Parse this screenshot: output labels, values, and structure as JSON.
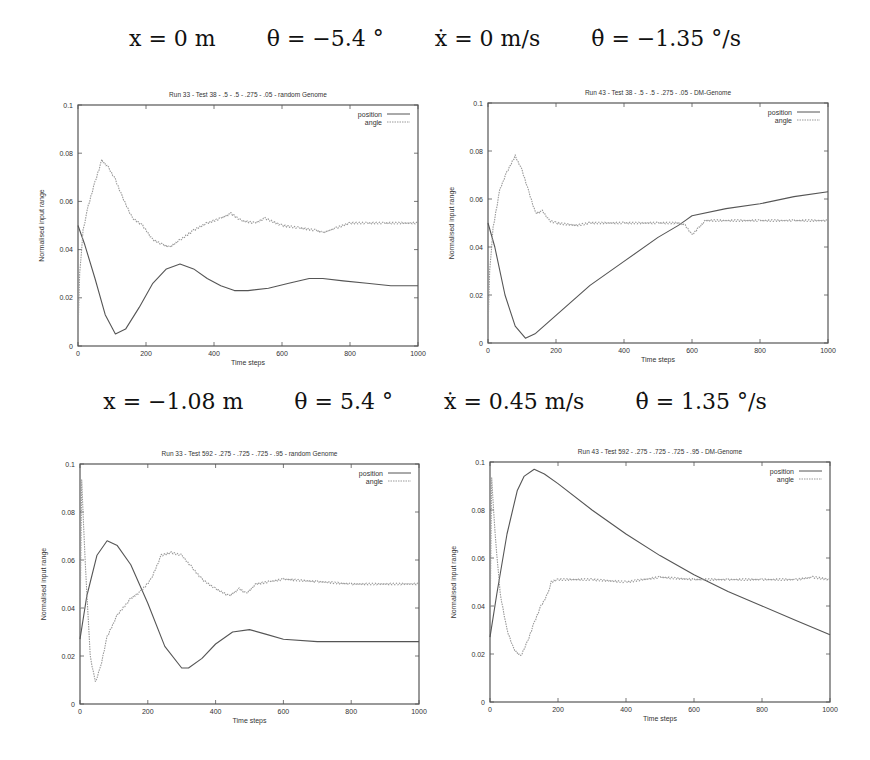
{
  "conditions": [
    {
      "x": "x = 0 m",
      "theta": "θ = −5.4 °",
      "xdot": "ẋ = 0 m/s",
      "thetadot": "θ̇ = −1.35 °/s"
    },
    {
      "x": "x = −1.08 m",
      "theta": "θ = 5.4 °",
      "xdot": "ẋ = 0.45 m/s",
      "thetadot": "θ̇ = 1.35 °/s"
    }
  ],
  "chart_data": [
    {
      "type": "line",
      "title": "Run 33 - Test 38 - .5 - .5 - .275 - .05 - random Genome",
      "xlabel": "Time steps",
      "ylabel": "Normalised input range",
      "xlim": [
        0,
        1000
      ],
      "ylim": [
        0,
        0.1
      ],
      "xticks": [
        "0",
        "200",
        "400",
        "600",
        "800",
        "1000"
      ],
      "yticks": [
        "0",
        "0.02",
        "0.04",
        "0.06",
        "0.08",
        "0.1"
      ],
      "legend": [
        "position",
        "angle"
      ],
      "legend_position": "top-right",
      "grid": false,
      "series": [
        {
          "name": "position",
          "x": [
            0,
            20,
            50,
            80,
            110,
            140,
            180,
            220,
            260,
            300,
            340,
            380,
            420,
            460,
            500,
            560,
            620,
            680,
            720,
            780,
            850,
            920,
            1000
          ],
          "values": [
            0.05,
            0.042,
            0.028,
            0.013,
            0.005,
            0.007,
            0.016,
            0.026,
            0.032,
            0.034,
            0.032,
            0.028,
            0.025,
            0.023,
            0.023,
            0.024,
            0.026,
            0.028,
            0.028,
            0.027,
            0.026,
            0.025,
            0.025
          ]
        },
        {
          "name": "angle",
          "x": [
            0,
            5,
            15,
            30,
            50,
            70,
            90,
            110,
            130,
            160,
            190,
            220,
            250,
            270,
            300,
            340,
            380,
            420,
            450,
            480,
            520,
            550,
            600,
            650,
            700,
            720,
            760,
            800,
            850,
            900,
            1000
          ],
          "values": [
            0.005,
            0.03,
            0.048,
            0.058,
            0.068,
            0.077,
            0.074,
            0.069,
            0.062,
            0.053,
            0.05,
            0.044,
            0.042,
            0.041,
            0.044,
            0.048,
            0.051,
            0.053,
            0.055,
            0.052,
            0.051,
            0.053,
            0.05,
            0.049,
            0.048,
            0.047,
            0.049,
            0.051,
            0.051,
            0.051,
            0.051
          ]
        }
      ]
    },
    {
      "type": "line",
      "title": "Run 43 - Test 38 - .5 - .5 - .275 - .05 - DM-Genome",
      "xlabel": "Time steps",
      "ylabel": "Normalised input range",
      "xlim": [
        0,
        1000
      ],
      "ylim": [
        0,
        0.1
      ],
      "xticks": [
        "0",
        "200",
        "400",
        "600",
        "800",
        "1000"
      ],
      "yticks": [
        "0",
        "0.02",
        "0.04",
        "0.06",
        "0.08",
        "0.1"
      ],
      "legend": [
        "position",
        "angle"
      ],
      "legend_position": "top-right",
      "grid": false,
      "series": [
        {
          "name": "position",
          "x": [
            0,
            20,
            50,
            80,
            110,
            140,
            180,
            220,
            300,
            400,
            500,
            560,
            580,
            600,
            700,
            800,
            900,
            1000
          ],
          "values": [
            0.05,
            0.04,
            0.02,
            0.007,
            0.002,
            0.004,
            0.009,
            0.014,
            0.024,
            0.034,
            0.044,
            0.049,
            0.051,
            0.053,
            0.056,
            0.058,
            0.061,
            0.063
          ]
        },
        {
          "name": "angle",
          "x": [
            0,
            5,
            15,
            35,
            55,
            80,
            100,
            120,
            140,
            160,
            180,
            200,
            260,
            300,
            400,
            500,
            560,
            580,
            600,
            620,
            640,
            700,
            800,
            900,
            1000
          ],
          "values": [
            0.005,
            0.03,
            0.048,
            0.064,
            0.071,
            0.078,
            0.072,
            0.063,
            0.054,
            0.055,
            0.051,
            0.05,
            0.049,
            0.05,
            0.05,
            0.05,
            0.05,
            0.049,
            0.045,
            0.048,
            0.051,
            0.051,
            0.051,
            0.051,
            0.051
          ]
        }
      ]
    },
    {
      "type": "line",
      "title": "Run 33 - Test 592 - .275 - .725 - .725 - .95 - random Genome",
      "xlabel": "Time steps",
      "ylabel": "Normalised input range",
      "xlim": [
        0,
        1000
      ],
      "ylim": [
        0,
        0.1
      ],
      "xticks": [
        "0",
        "200",
        "400",
        "600",
        "800",
        "1000"
      ],
      "yticks": [
        "0",
        "0.02",
        "0.04",
        "0.06",
        "0.08",
        "0.1"
      ],
      "legend": [
        "position",
        "angle"
      ],
      "legend_position": "top-right",
      "grid": false,
      "series": [
        {
          "name": "position",
          "x": [
            0,
            20,
            50,
            80,
            110,
            150,
            200,
            250,
            300,
            320,
            360,
            400,
            450,
            500,
            550,
            600,
            700,
            800,
            900,
            1000
          ],
          "values": [
            0.027,
            0.045,
            0.062,
            0.068,
            0.066,
            0.058,
            0.042,
            0.024,
            0.015,
            0.015,
            0.019,
            0.025,
            0.03,
            0.031,
            0.029,
            0.027,
            0.026,
            0.026,
            0.026,
            0.026
          ]
        },
        {
          "name": "angle",
          "x": [
            0,
            5,
            15,
            30,
            45,
            60,
            80,
            110,
            150,
            180,
            210,
            240,
            270,
            300,
            330,
            360,
            400,
            440,
            470,
            490,
            520,
            560,
            600,
            700,
            800,
            1000
          ],
          "values": [
            0.03,
            0.093,
            0.06,
            0.02,
            0.009,
            0.015,
            0.028,
            0.037,
            0.044,
            0.047,
            0.052,
            0.062,
            0.063,
            0.062,
            0.057,
            0.052,
            0.048,
            0.045,
            0.048,
            0.046,
            0.05,
            0.051,
            0.052,
            0.051,
            0.05,
            0.05
          ]
        }
      ]
    },
    {
      "type": "line",
      "title": "Run 43 - Test 592 - .275 - .725 - .725 - .95 - DM-Genome",
      "xlabel": "Time steps",
      "ylabel": "Normalised input range",
      "xlim": [
        0,
        1000
      ],
      "ylim": [
        0,
        0.1
      ],
      "xticks": [
        "0",
        "200",
        "400",
        "600",
        "800",
        "1000"
      ],
      "yticks": [
        "0",
        "0.02",
        "0.04",
        "0.06",
        "0.08",
        "0.1"
      ],
      "legend": [
        "position",
        "angle"
      ],
      "legend_position": "top-right",
      "grid": false,
      "series": [
        {
          "name": "position",
          "x": [
            0,
            20,
            50,
            80,
            100,
            130,
            160,
            200,
            300,
            400,
            500,
            600,
            700,
            800,
            900,
            1000
          ],
          "values": [
            0.027,
            0.045,
            0.07,
            0.088,
            0.094,
            0.097,
            0.095,
            0.091,
            0.08,
            0.07,
            0.061,
            0.053,
            0.046,
            0.04,
            0.034,
            0.028
          ]
        },
        {
          "name": "angle",
          "x": [
            0,
            5,
            15,
            30,
            50,
            70,
            90,
            110,
            130,
            150,
            170,
            180,
            200,
            300,
            400,
            500,
            600,
            700,
            800,
            900,
            950,
            1000
          ],
          "values": [
            0.03,
            0.093,
            0.07,
            0.045,
            0.03,
            0.022,
            0.019,
            0.025,
            0.033,
            0.04,
            0.045,
            0.05,
            0.051,
            0.051,
            0.05,
            0.052,
            0.051,
            0.051,
            0.051,
            0.051,
            0.052,
            0.051
          ]
        }
      ]
    }
  ]
}
